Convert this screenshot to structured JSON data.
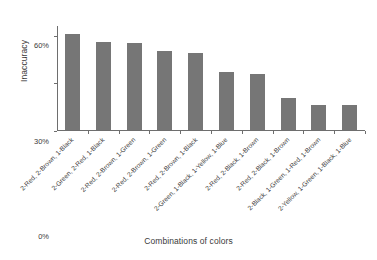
{
  "chart_data": {
    "type": "bar",
    "title": "",
    "xlabel": "Combinations of colors",
    "ylabel": "Inaccuracy",
    "ylim": [
      0,
      66
    ],
    "yticks": [
      0,
      30,
      60
    ],
    "ytick_labels": [
      "0%",
      "30%",
      "60%"
    ],
    "grid": false,
    "legend": null,
    "bar_color": "#767676",
    "axis_color": "#6e6e6e",
    "categories": [
      "2-Red, 2-Brown, 1-Black",
      "2-Green, 2-Red, 1-Black",
      "2-Red, 2-Brown, 1-Green",
      "2-Red, 2-Brown, 1-Green",
      "2-Red, 2-Brown, 1-Black",
      "2-Green, 1-Black, 1-Yellow, 1-Blue",
      "2-Red, 2-Black, 1-Brown",
      "2-Red, 2-Black, 1-Brown",
      "2-Black, 1-Green, 1-Red, 1-Brown",
      "2-Yellow, 1-Green, 1-Black, 1-Blue"
    ],
    "values": [
      60.5,
      55.5,
      54.5,
      49.5,
      48.5,
      36.5,
      35.0,
      20.0,
      15.5,
      15.5
    ]
  }
}
